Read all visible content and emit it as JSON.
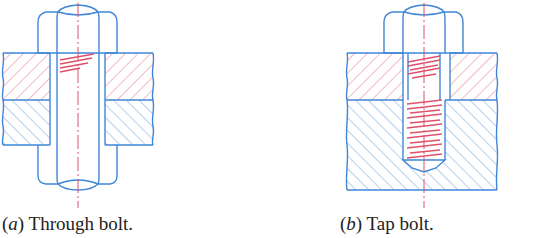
{
  "colors": {
    "outline": "#3f86d8",
    "section_red": "#e8788c",
    "section_blue": "#6aa2de",
    "thread": "#e0506a",
    "centerline": "#e0506a",
    "text": "#222222"
  },
  "figures": [
    {
      "id": "a",
      "caption_letter": "a",
      "caption_text": " Through bolt.",
      "type": "through-bolt"
    },
    {
      "id": "b",
      "caption_letter": "b",
      "caption_text": " Tap bolt.",
      "type": "tap-bolt"
    }
  ]
}
